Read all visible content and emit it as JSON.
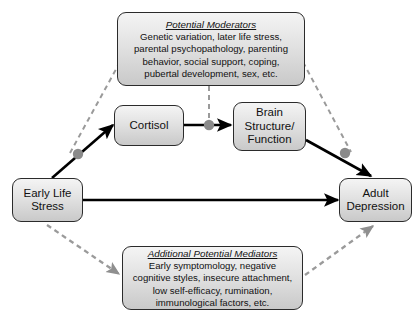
{
  "diagram": {
    "colors": {
      "box_border": "#2b2b2b",
      "box_fill_top": "#f4f4f4",
      "box_fill_bottom": "#c9c9c9",
      "solid_path": "#000000",
      "dashed_path": "#9a9a9a",
      "node_dot": "#8a8a8a",
      "background": "#ffffff"
    },
    "nodes": {
      "early_life_stress": {
        "id": "early-life-stress",
        "lines": [
          "Early Life",
          "Stress"
        ]
      },
      "cortisol": {
        "id": "cortisol",
        "lines": [
          "Cortisol"
        ]
      },
      "brain_structure_function": {
        "id": "brain-structure-function",
        "lines": [
          "Brain",
          "Structure/",
          "Function"
        ]
      },
      "adult_depression": {
        "id": "adult-depression",
        "lines": [
          "Adult",
          "Depression"
        ]
      },
      "potential_moderators": {
        "id": "potential-moderators",
        "title": "Potential Moderators",
        "lines": [
          "Genetic variation, later life stress,",
          "parental psychopathology, parenting",
          "behavior, social support, coping,",
          "pubertal development, sex, etc."
        ]
      },
      "additional_potential_mediators": {
        "id": "additional-potential-mediators",
        "title": "Additional Potential Mediators",
        "lines": [
          "Early symptomology, negative",
          "cognitive styles, insecure attachment,",
          "low self-efficacy, rumination,",
          "immunological factors, etc."
        ]
      }
    },
    "edges": [
      {
        "name": "early-life-stress-to-cortisol",
        "style": "solid",
        "arrow": true
      },
      {
        "name": "cortisol-to-brain-structure",
        "style": "solid",
        "arrow": true
      },
      {
        "name": "brain-structure-to-adult-depression",
        "style": "solid",
        "arrow": true
      },
      {
        "name": "early-life-stress-to-adult-depression",
        "style": "solid",
        "arrow": true
      },
      {
        "name": "moderators-to-early-cortisol-path",
        "style": "dashed",
        "arrow": false
      },
      {
        "name": "moderators-to-cortisol-brain-path",
        "style": "dashed",
        "arrow": false
      },
      {
        "name": "moderators-to-brain-depression-path",
        "style": "dashed",
        "arrow": false
      },
      {
        "name": "early-life-stress-to-mediators",
        "style": "dashed",
        "arrow": true
      },
      {
        "name": "mediators-to-adult-depression",
        "style": "dashed",
        "arrow": true
      }
    ],
    "junction_dots": [
      {
        "name": "moderator-junction-left"
      },
      {
        "name": "moderator-junction-center"
      },
      {
        "name": "moderator-junction-right"
      }
    ]
  }
}
